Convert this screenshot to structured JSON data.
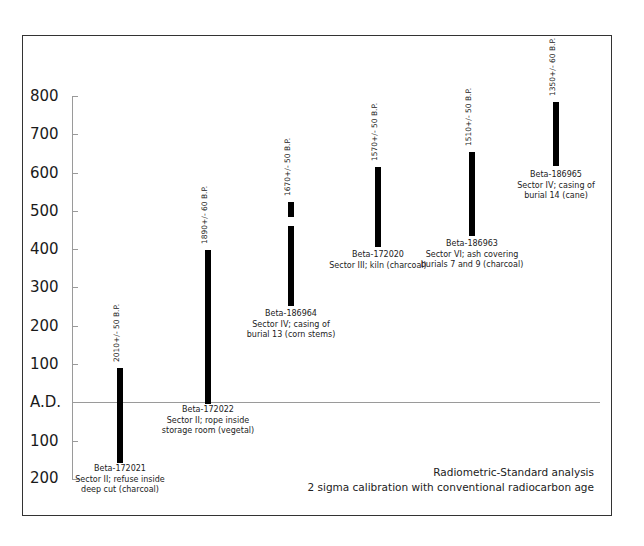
{
  "chart_data": {
    "type": "range-bar",
    "title": "",
    "xlabel": "",
    "ylabel": "",
    "y_ticks": [
      "800",
      "700",
      "600",
      "500",
      "400",
      "300",
      "200",
      "100",
      "A.D.",
      "100",
      "200"
    ],
    "y_tick_values": [
      800,
      700,
      600,
      500,
      400,
      300,
      200,
      100,
      0,
      -100,
      -200
    ],
    "ylim": [
      -200,
      800
    ],
    "reference_line": {
      "label": "A.D.",
      "value": 0
    },
    "series": [
      {
        "sample": "Beta-172021",
        "conventional_age": "2010+/- 50 B.P.",
        "description": [
          "Sector II; refuse inside",
          "deep cut (charcoal)"
        ],
        "ranges": [
          [
            -160,
            90
          ]
        ]
      },
      {
        "sample": "Beta-172022",
        "conventional_age": "1890+/- 60 B.P.",
        "description": [
          "Sector II; rope inside",
          "storage room (vegetal)"
        ],
        "ranges": [
          [
            0,
            250
          ]
        ]
      },
      {
        "sample": "Beta-186964",
        "conventional_age": "1670+/- 50 B.P.",
        "description": [
          "Sector IV; casing of",
          "burial 13 (corn stems)"
        ],
        "ranges": [
          [
            250,
            460
          ],
          [
            485,
            520
          ]
        ]
      },
      {
        "sample": "Beta-172020",
        "conventional_age": "1570+/- 50 B.P.",
        "description": [
          "Sector III; kiln (charcoal)"
        ],
        "ranges": [
          [
            405,
            613
          ]
        ]
      },
      {
        "sample": "Beta-186963",
        "conventional_age": "1510+/- 50 B.P.",
        "description": [
          "Sector VI; ash covering",
          "burials 7 and 9 (charcoal)"
        ],
        "ranges": [
          [
            433,
            652
          ]
        ]
      },
      {
        "sample": "Beta-186965",
        "conventional_age": "1350+/- 60 B.P.",
        "description": [
          "Sector IV; casing of",
          "burial 14 (cane)"
        ],
        "ranges": [
          [
            616,
            783
          ]
        ]
      }
    ],
    "annotations": [
      "Radiometric-Standard analysis",
      "2 sigma calibration with conventional radiocarbon age"
    ],
    "grid": false,
    "legend": null
  },
  "axis": {
    "labels": [
      "800",
      "700",
      "600",
      "500",
      "400",
      "300",
      "200",
      "100",
      "A.D.",
      "100",
      "200"
    ]
  },
  "samples": [
    {
      "date": "2010+/- 50 B.P.",
      "id": "Beta-172021",
      "line1": "Sector II; refuse inside",
      "line2": "deep cut (charcoal)"
    },
    {
      "date": "1890+/- 60 B.P.",
      "id": "Beta-172022",
      "line1": "Sector II; rope inside",
      "line2": "storage room (vegetal)"
    },
    {
      "date": "1670+/- 50 B.P.",
      "id": "Beta-186964",
      "line1": "Sector IV; casing of",
      "line2": "burial 13 (corn stems)"
    },
    {
      "date": "1570+/- 50 B.P.",
      "id": "Beta-172020",
      "line1": "Sector III; kiln (charcoal)",
      "line2": ""
    },
    {
      "date": "1510+/- 50 B.P.",
      "id": "Beta-186963",
      "line1": "Sector VI; ash covering",
      "line2": "burials 7 and 9 (charcoal)"
    },
    {
      "date": "1350+/- 60 B.P.",
      "id": "Beta-186965",
      "line1": "Sector IV; casing of",
      "line2": "burial 14 (cane)"
    }
  ],
  "note": {
    "line1": "Radiometric-Standard analysis",
    "line2": "2 sigma calibration with conventional radiocarbon age"
  }
}
